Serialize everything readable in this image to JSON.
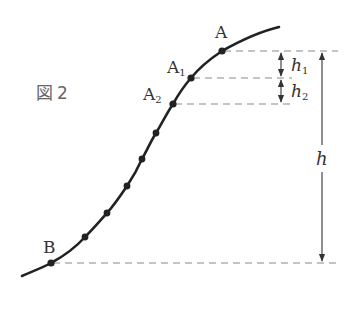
{
  "figure": {
    "label": "図 2",
    "label_char": "図",
    "label_num": "2"
  },
  "points": [
    {
      "name": "A",
      "label": "A",
      "sub": ""
    },
    {
      "name": "A1",
      "label": "A",
      "sub": "1"
    },
    {
      "name": "A2",
      "label": "A",
      "sub": "2"
    },
    {
      "name": "B",
      "label": "B",
      "sub": ""
    }
  ],
  "dimensions": {
    "h1": {
      "label": "h",
      "sub": "1"
    },
    "h2": {
      "label": "h",
      "sub": "2"
    },
    "h": {
      "label": "h"
    }
  },
  "colors": {
    "curve": "#222222",
    "dashed": "#888888",
    "arrow": "#333333",
    "text": "#333333"
  }
}
